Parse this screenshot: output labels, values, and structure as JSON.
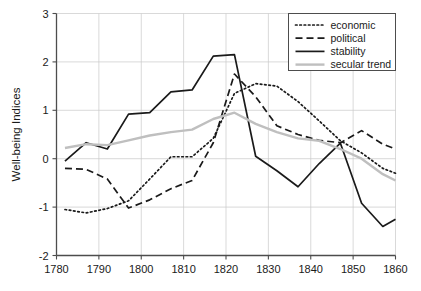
{
  "chart_data": {
    "type": "line",
    "title": "",
    "xlabel": "",
    "ylabel": "Well-being Indices",
    "xlim": [
      1780,
      1860
    ],
    "ylim": [
      -2,
      3
    ],
    "xticks": [
      1780,
      1790,
      1800,
      1810,
      1820,
      1830,
      1840,
      1850,
      1860
    ],
    "yticks": [
      -2,
      -1,
      0,
      1,
      2,
      3
    ],
    "xtick_labels": [
      "1780",
      "1790",
      "1800",
      "1810",
      "1820",
      "1830",
      "1840",
      "1850",
      "1860"
    ],
    "ytick_labels": [
      "-2",
      "-1",
      "0",
      "1",
      "2",
      "3"
    ],
    "grid": true,
    "grid_color": "#c8c8c8",
    "legend_position": "top-right",
    "series": [
      {
        "name": "economic",
        "style": "dotted",
        "color": "#1a1a1a",
        "x": [
          1782,
          1787,
          1792,
          1797,
          1802,
          1807,
          1812,
          1817,
          1822,
          1827,
          1832,
          1837,
          1842,
          1847,
          1852,
          1857,
          1860
        ],
        "values": [
          -1.05,
          -1.12,
          -1.03,
          -0.87,
          -0.42,
          0.04,
          0.04,
          0.42,
          1.35,
          1.55,
          1.5,
          1.18,
          0.78,
          0.37,
          0.12,
          -0.2,
          -0.3
        ]
      },
      {
        "name": "political",
        "style": "dashed",
        "color": "#1a1a1a",
        "x": [
          1782,
          1787,
          1792,
          1797,
          1802,
          1807,
          1812,
          1817,
          1822,
          1827,
          1832,
          1837,
          1842,
          1847,
          1852,
          1857,
          1860
        ],
        "values": [
          -0.2,
          -0.22,
          -0.42,
          -1.02,
          -0.85,
          -0.62,
          -0.45,
          0.33,
          1.75,
          1.28,
          0.68,
          0.5,
          0.38,
          0.33,
          0.58,
          0.3,
          0.2
        ]
      },
      {
        "name": "stability",
        "style": "solid",
        "color": "#1a1a1a",
        "x": [
          1782,
          1787,
          1792,
          1797,
          1802,
          1807,
          1812,
          1817,
          1822,
          1827,
          1832,
          1837,
          1842,
          1847,
          1852,
          1857,
          1860
        ],
        "values": [
          -0.05,
          0.33,
          0.2,
          0.92,
          0.95,
          1.38,
          1.42,
          2.12,
          2.15,
          0.05,
          -0.25,
          -0.58,
          -0.1,
          0.32,
          -0.92,
          -1.4,
          -1.25
        ]
      },
      {
        "name": "secular trend",
        "style": "solid",
        "color": "#bfbfbf",
        "x": [
          1782,
          1787,
          1792,
          1797,
          1802,
          1807,
          1812,
          1817,
          1822,
          1827,
          1832,
          1837,
          1842,
          1847,
          1852,
          1857,
          1860
        ],
        "values": [
          0.22,
          0.3,
          0.28,
          0.38,
          0.48,
          0.55,
          0.6,
          0.82,
          0.95,
          0.72,
          0.55,
          0.42,
          0.37,
          0.2,
          0.0,
          -0.32,
          -0.45
        ]
      }
    ]
  },
  "legend": {
    "items": [
      {
        "label": "economic"
      },
      {
        "label": "political"
      },
      {
        "label": "stability"
      },
      {
        "label": "secular trend"
      }
    ]
  },
  "axis": {
    "y_title": "Well-being Indices"
  }
}
